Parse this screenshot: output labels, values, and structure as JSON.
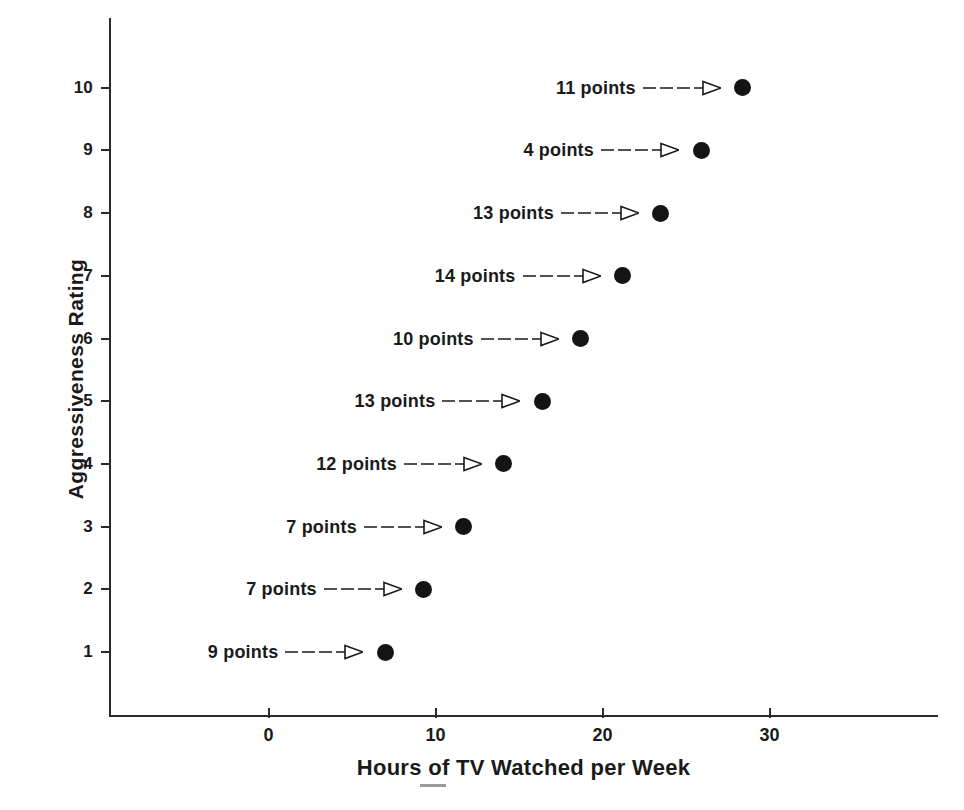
{
  "chart_data": {
    "type": "scatter",
    "title": "",
    "xlabel": "Hours of TV Watched per Week",
    "ylabel": "Aggressiveness Rating",
    "xlim": [
      -6.5,
      40
    ],
    "ylim": [
      0.2,
      11.3
    ],
    "xticks": [
      0,
      10,
      20,
      30
    ],
    "xtick_labels": [
      "0",
      "10",
      "20",
      "30"
    ],
    "yticks": [
      1,
      2,
      3,
      4,
      5,
      6,
      7,
      8,
      9,
      10
    ],
    "ytick_labels": [
      "1",
      "2",
      "3",
      "4",
      "5",
      "6",
      "7",
      "8",
      "9",
      "10"
    ],
    "grid": false,
    "legend": null,
    "marker": "filled-circle",
    "points": [
      {
        "rating": 10,
        "hours": 28.4,
        "annotation": "11 points"
      },
      {
        "rating": 9,
        "hours": 25.9,
        "annotation": "4 points"
      },
      {
        "rating": 8,
        "hours": 23.5,
        "annotation": "13 points"
      },
      {
        "rating": 7,
        "hours": 21.2,
        "annotation": "14 points"
      },
      {
        "rating": 6,
        "hours": 18.7,
        "annotation": "10 points"
      },
      {
        "rating": 5,
        "hours": 16.4,
        "annotation": "13 points"
      },
      {
        "rating": 4,
        "hours": 14.1,
        "annotation": "12 points"
      },
      {
        "rating": 3,
        "hours": 11.7,
        "annotation": "7 points"
      },
      {
        "rating": 2,
        "hours": 9.3,
        "annotation": "7 points"
      },
      {
        "rating": 1,
        "hours": 7.0,
        "annotation": "9 points"
      }
    ],
    "annotation_arrow": "right-arrow-open-head",
    "colors": {
      "marker": "#141414",
      "axis": "#2b2b2b",
      "text": "#1a1a1a",
      "background": "#ffffff"
    }
  },
  "caption_remnant": ""
}
